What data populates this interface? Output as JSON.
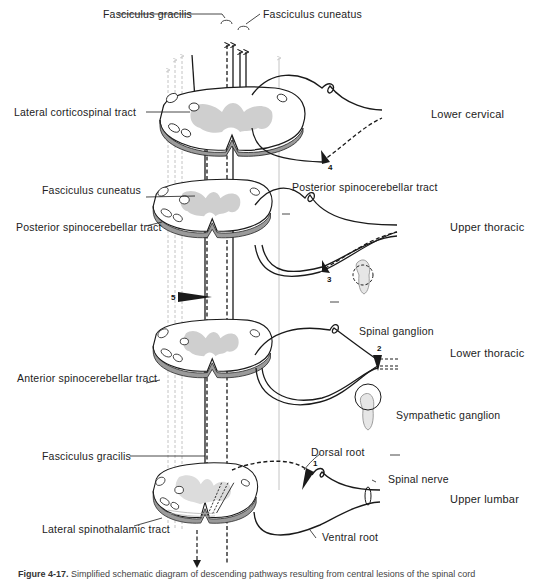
{
  "figure": {
    "caption_label": "Figure 4-17.",
    "caption_text": "Simplified schematic diagram of descending pathways resulting from central lesions of the spinal cord"
  },
  "levels": [
    {
      "id": "lower-cervical",
      "label": "Lower cervical"
    },
    {
      "id": "upper-thoracic",
      "label": "Upper thoracic"
    },
    {
      "id": "lower-thoracic",
      "label": "Lower thoracic"
    },
    {
      "id": "upper-lumbar",
      "label": "Upper lumbar"
    }
  ],
  "labels": {
    "fasciculus_gracilis_top": "Fasciculus gracilis",
    "fasciculus_cuneatus_top": "Fasciculus cuneatus",
    "lateral_corticospinal_tract": "Lateral corticospinal tract",
    "fasciculus_cuneatus_mid": "Fasciculus cuneatus",
    "posterior_spinocerebellar_tract_left": "Posterior spinocerebellar tract",
    "posterior_spinocerebellar_tract_right": "Posterior spinocerebellar tract",
    "spinal_ganglion": "Spinal ganglion",
    "anterior_spinocerebellar_tract": "Anterior spinocerebellar tract",
    "sympathetic_ganglion": "Sympathetic ganglion",
    "fasciculus_gracilis_bottom": "Fasciculus gracilis",
    "dorsal_root": "Dorsal root",
    "spinal_nerve": "Spinal nerve",
    "lateral_spinothalamic_tract": "Lateral spinothalamic tract",
    "ventral_root": "Ventral root"
  },
  "markers": {
    "m1": "1",
    "m2": "2",
    "m3": "3",
    "m4": "4",
    "m5": "5"
  },
  "colors": {
    "ink": "#1a1a1a",
    "gray_matter": "#cfcfcf",
    "faint_tract": "#c4c4c4",
    "background": "#ffffff"
  }
}
